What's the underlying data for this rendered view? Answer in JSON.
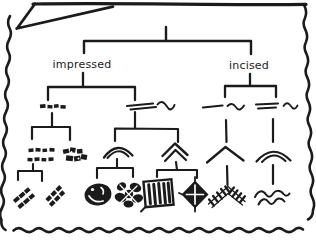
{
  "panel": {
    "style": "hand-drawn comic speech-bubble panel with scalloped border and tail at top-left",
    "background": "#ffffff",
    "ink": "#1b1b1b"
  },
  "diagram": {
    "type": "tree",
    "branches": [
      {
        "label": "impressed",
        "children": [
          {
            "icon": "dash-row-icon",
            "children": [
              {
                "icon": "double-dash-rows-icon",
                "children": [
                  {
                    "icon": "diagonal-stamp-cluster-icon"
                  },
                  {
                    "icon": "diagonal-stamp-cluster-icon"
                  }
                ]
              },
              {
                "icon": "blob-stamp-cluster-icon"
              }
            ]
          },
          {
            "icon": "double-line-wave-icon",
            "children": [
              {
                "icon": "single-arc-icon",
                "children": [
                  {
                    "icon": "dark-oval-stamp-icon"
                  },
                  {
                    "icon": "petal-rosette-stamp-icon"
                  }
                ]
              },
              {
                "icon": "double-chevron-icon",
                "children": [
                  {
                    "icon": "hatched-rectangle-stamp-icon"
                  },
                  {
                    "icon": "diamond-cross-stamp-icon"
                  }
                ]
              }
            ]
          }
        ]
      },
      {
        "label": "incised",
        "children": [
          {
            "icon": "line-and-wave-icon",
            "children": [
              {
                "icon": "chevron-icon",
                "children": [
                  {
                    "icon": "hatched-chevron-icon"
                  }
                ]
              }
            ]
          },
          {
            "icon": "double-line-and-wave-icon",
            "children": [
              {
                "icon": "double-arc-icon",
                "children": [
                  {
                    "icon": "double-wave-icon"
                  }
                ]
              }
            ]
          }
        ]
      }
    ]
  }
}
